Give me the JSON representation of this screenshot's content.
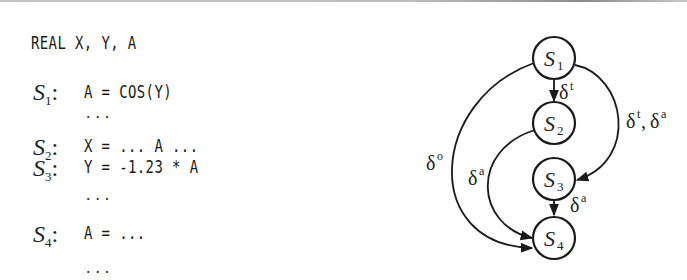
{
  "code": {
    "declaration": "REAL X, Y, A",
    "statements": [
      {
        "label": "S",
        "sub": "1",
        "code": "A = COS(Y)"
      },
      {
        "label": "S",
        "sub": "2",
        "code": "X = ... A ..."
      },
      {
        "label": "S",
        "sub": "3",
        "code": "Y = -1.23 * A"
      },
      {
        "label": "S",
        "sub": "4",
        "code": "A = ..."
      }
    ],
    "ellipsis": "..."
  },
  "graph": {
    "nodes": [
      {
        "id": "S1",
        "label": "S",
        "sub": "1"
      },
      {
        "id": "S2",
        "label": "S",
        "sub": "2"
      },
      {
        "id": "S3",
        "label": "S",
        "sub": "3"
      },
      {
        "id": "S4",
        "label": "S",
        "sub": "4"
      }
    ],
    "edges": [
      {
        "from": "S1",
        "to": "S2",
        "label": "δ",
        "sup": "t"
      },
      {
        "from": "S1",
        "to": "S3",
        "label": "δ",
        "sup": "t",
        "label2": "δ",
        "sup2": "a",
        "sep": ","
      },
      {
        "from": "S1",
        "to": "S4",
        "label": "δ",
        "sup": "o"
      },
      {
        "from": "S2",
        "to": "S4",
        "label": "δ",
        "sup": "a"
      },
      {
        "from": "S3",
        "to": "S4",
        "label": "δ",
        "sup": "a"
      }
    ]
  }
}
